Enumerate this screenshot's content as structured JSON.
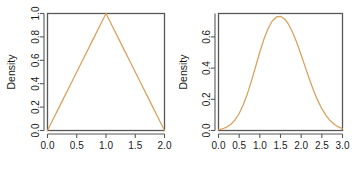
{
  "figure": {
    "background_color": "#ffffff",
    "panel_count": 2
  },
  "style": {
    "curve_color": "#d9a05a",
    "frame_color": "#585858",
    "text_color": "#1a1a1a"
  },
  "chart_data": [
    {
      "type": "line",
      "title": "",
      "xlabel": "",
      "ylabel": "Density",
      "xlim": [
        0.0,
        2.0
      ],
      "ylim": [
        0.0,
        1.0
      ],
      "grid": false,
      "legend": false,
      "xticks": [
        "0.0",
        "0.5",
        "1.0",
        "1.5",
        "2.0"
      ],
      "xtick_values": [
        0.0,
        0.5,
        1.0,
        1.5,
        2.0
      ],
      "yticks": [
        "0.0",
        "0.2",
        "0.4",
        "0.6",
        "0.8",
        "1.0"
      ],
      "ytick_values": [
        0.0,
        0.2,
        0.4,
        0.6,
        0.8,
        1.0
      ],
      "series": [
        {
          "name": "Triangular density",
          "x": [
            0.0,
            0.1,
            0.2,
            0.3,
            0.4,
            0.5,
            0.6,
            0.7,
            0.8,
            0.9,
            1.0,
            1.1,
            1.2,
            1.3,
            1.4,
            1.5,
            1.6,
            1.7,
            1.8,
            1.9,
            2.0
          ],
          "values": [
            0.0,
            0.1,
            0.2,
            0.3,
            0.4,
            0.5,
            0.6,
            0.7,
            0.8,
            0.9,
            1.0,
            0.9,
            0.8,
            0.7,
            0.6,
            0.5,
            0.4,
            0.3,
            0.2,
            0.1,
            0.0
          ]
        }
      ]
    },
    {
      "type": "line",
      "title": "",
      "xlabel": "",
      "ylabel": "Density",
      "xlim": [
        0.0,
        3.0
      ],
      "ylim": [
        0.0,
        0.75
      ],
      "grid": false,
      "legend": false,
      "xticks": [
        "0.0",
        "0.5",
        "1.0",
        "1.5",
        "2.0",
        "2.5",
        "3.0"
      ],
      "xtick_values": [
        0.0,
        0.5,
        1.0,
        1.5,
        2.0,
        2.5,
        3.0
      ],
      "yticks": [
        "0.0",
        "0.2",
        "0.4",
        "0.6"
      ],
      "ytick_values": [
        0.0,
        0.2,
        0.4,
        0.6
      ],
      "series": [
        {
          "name": "Bell-shaped density",
          "x": [
            0.0,
            0.1,
            0.2,
            0.3,
            0.4,
            0.5,
            0.6,
            0.7,
            0.8,
            0.9,
            1.0,
            1.1,
            1.2,
            1.3,
            1.4,
            1.5,
            1.6,
            1.7,
            1.8,
            1.9,
            2.0,
            2.1,
            2.2,
            2.3,
            2.4,
            2.5,
            2.6,
            2.7,
            2.8,
            2.9,
            3.0
          ],
          "values": [
            0.005,
            0.011,
            0.022,
            0.04,
            0.068,
            0.109,
            0.165,
            0.236,
            0.32,
            0.412,
            0.503,
            0.586,
            0.654,
            0.702,
            0.728,
            0.732,
            0.715,
            0.678,
            0.625,
            0.559,
            0.484,
            0.406,
            0.329,
            0.257,
            0.193,
            0.14,
            0.097,
            0.064,
            0.04,
            0.023,
            0.012
          ]
        }
      ]
    }
  ]
}
